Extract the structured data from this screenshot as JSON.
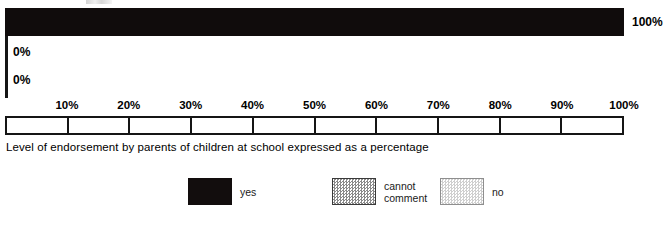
{
  "chart_data": {
    "type": "bar",
    "orientation": "horizontal",
    "title": "",
    "caption": "Level of endorsement by parents of children at school expressed as a percentage",
    "xlabel": "",
    "ylabel": "",
    "xlim": [
      0,
      100
    ],
    "grid": false,
    "categories": [
      "yes",
      "cannot comment",
      "no"
    ],
    "values": [
      100,
      0,
      0
    ],
    "value_labels": [
      "100%",
      "0%",
      "0%"
    ],
    "axis_ticks": [
      {
        "value": 0,
        "label": ""
      },
      {
        "value": 10,
        "label": "10%"
      },
      {
        "value": 20,
        "label": "20%"
      },
      {
        "value": 30,
        "label": "30%"
      },
      {
        "value": 40,
        "label": "40%"
      },
      {
        "value": 50,
        "label": "50%"
      },
      {
        "value": 60,
        "label": "60%"
      },
      {
        "value": 70,
        "label": "70%"
      },
      {
        "value": 80,
        "label": "80%"
      },
      {
        "value": 90,
        "label": "90%"
      },
      {
        "value": 100,
        "label": "100%"
      }
    ],
    "legend": {
      "position": "bottom",
      "entries": [
        {
          "label": "yes",
          "swatch": "solid-black",
          "color": "#120d0d"
        },
        {
          "label": "cannot\ncomment",
          "swatch": "mid-dither",
          "color": "#8a8a8a"
        },
        {
          "label": "no",
          "swatch": "light-dither",
          "color": "#cfcfcf"
        }
      ]
    },
    "colors": {
      "bar": "#120d0d",
      "axis": "#151515",
      "background": "#ffffff",
      "text": "#000000"
    }
  }
}
